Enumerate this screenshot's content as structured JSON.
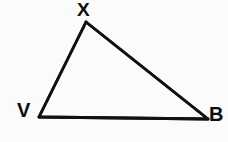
{
  "figure": {
    "kind": "geometry-diagram",
    "shape": "triangle",
    "background_color": "#fbfbfb",
    "stroke_color": "#111111",
    "stroke_width": 2.8,
    "label_color": "#0d0d0d",
    "width": 228,
    "height": 142
  },
  "vertices": [
    {
      "id": "x",
      "label": "X",
      "x": 86,
      "y": 22,
      "label_x": 77,
      "label_y": 0,
      "label_position": "above"
    },
    {
      "id": "v",
      "label": "V",
      "x": 39,
      "y": 117,
      "label_x": 17,
      "label_y": 100,
      "label_position": "left"
    },
    {
      "id": "b",
      "label": "B",
      "x": 208,
      "y": 119,
      "label_x": 209,
      "label_y": 104,
      "label_position": "right"
    }
  ],
  "edges": [
    {
      "id": "vx",
      "from": "v",
      "to": "x",
      "name": "edge-v-x"
    },
    {
      "id": "xb",
      "from": "x",
      "to": "b",
      "name": "edge-x-b"
    },
    {
      "id": "bv",
      "from": "b",
      "to": "v",
      "name": "edge-b-v"
    }
  ],
  "path": {
    "d": "M 39 117 L 86 22 L 208 119 Z"
  }
}
